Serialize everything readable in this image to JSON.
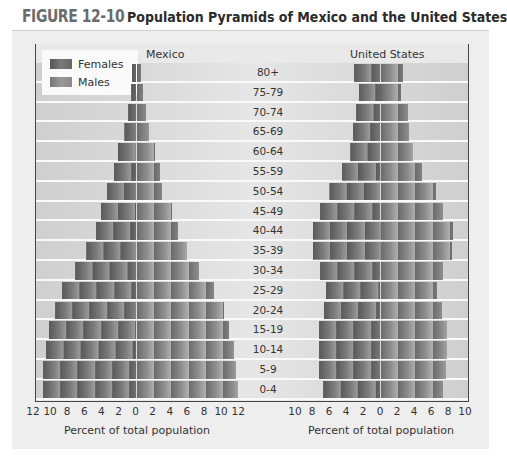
{
  "figure": {
    "number": "FIGURE 12-10",
    "title": "Population Pyramids of Mexico and the United States"
  },
  "legend": {
    "females": "Females",
    "males": "Males"
  },
  "colors": {
    "females": "#5e5e5e",
    "males": "#8c8c8c",
    "background": "#eeeeee"
  },
  "chart_data": [
    {
      "type": "bar",
      "orientation": "horizontal-population-pyramid",
      "title": "Mexico",
      "xlabel": "Percent of total population",
      "xlim": [
        -12,
        12
      ],
      "xticks": [
        "12",
        "10",
        "8",
        "6",
        "4",
        "2",
        "0",
        "2",
        "4",
        "6",
        "8",
        "10",
        "12"
      ],
      "categories": [
        "80+",
        "75-79",
        "70-74",
        "65-69",
        "60-64",
        "55-59",
        "50-54",
        "45-49",
        "40-44",
        "35-39",
        "30-34",
        "25-29",
        "20-24",
        "15-19",
        "10-14",
        "5-9",
        "0-4"
      ],
      "series": [
        {
          "name": "Females",
          "side": "left",
          "values": [
            0.5,
            0.7,
            1.0,
            1.5,
            2.2,
            2.6,
            3.4,
            4.1,
            4.7,
            5.9,
            7.2,
            8.7,
            9.5,
            10.2,
            10.6,
            10.9,
            10.9
          ]
        },
        {
          "name": "Males",
          "side": "right",
          "values": [
            0.5,
            0.8,
            1.1,
            1.5,
            2.2,
            2.7,
            3.0,
            4.1,
            4.9,
            5.9,
            7.3,
            9.1,
            10.2,
            10.8,
            11.4,
            11.6,
            11.9
          ]
        }
      ],
      "grid": false,
      "legend_position": "upper-left"
    },
    {
      "type": "bar",
      "orientation": "horizontal-population-pyramid",
      "title": "United States",
      "xlabel": "Percent of total population",
      "xlim": [
        -10,
        10
      ],
      "xticks": [
        "10",
        "8",
        "6",
        "4",
        "2",
        "0",
        "2",
        "4",
        "6",
        "8",
        "10"
      ],
      "categories": [
        "80+",
        "75-79",
        "70-74",
        "65-69",
        "60-64",
        "55-59",
        "50-54",
        "45-49",
        "40-44",
        "35-39",
        "30-34",
        "25-29",
        "20-24",
        "15-19",
        "10-14",
        "5-9",
        "0-4"
      ],
      "series": [
        {
          "name": "Females",
          "side": "left",
          "values": [
            3.1,
            2.5,
            2.9,
            3.2,
            3.6,
            4.5,
            6.1,
            7.1,
            8.0,
            8.0,
            7.1,
            6.4,
            6.6,
            7.2,
            7.2,
            7.2,
            6.8
          ]
        },
        {
          "name": "Males",
          "side": "right",
          "values": [
            2.6,
            2.4,
            3.2,
            3.4,
            3.8,
            4.9,
            6.5,
            7.4,
            8.5,
            8.4,
            7.4,
            6.7,
            7.2,
            7.8,
            7.8,
            7.7,
            7.3
          ]
        }
      ],
      "grid": false
    }
  ]
}
